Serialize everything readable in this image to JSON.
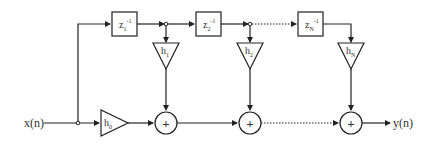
{
  "diagram": {
    "input_label": "x(n)",
    "output_label": "y(n)",
    "delays": [
      {
        "base": "z",
        "sub": "1",
        "sup": "-1"
      },
      {
        "base": "z",
        "sub": "2",
        "sup": "-1"
      },
      {
        "base": "z",
        "sub": "N",
        "sup": "-1"
      }
    ],
    "gains": [
      {
        "base": "h",
        "sub": "0"
      },
      {
        "base": "h",
        "sub": "1"
      },
      {
        "base": "h",
        "sub": "2"
      },
      {
        "base": "h",
        "sub": "N"
      }
    ],
    "adder_symbol": "+",
    "colors": {
      "line": "#222222",
      "background": "#ffffff"
    }
  }
}
